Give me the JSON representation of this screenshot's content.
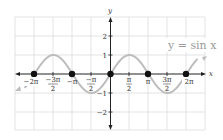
{
  "chart_data": {
    "type": "line",
    "title": "",
    "function_label": "y = sin x",
    "xlabel": "x",
    "ylabel": "y",
    "xlim": [
      -5.5,
      5.5
    ],
    "ylim": [
      -3,
      3
    ],
    "grid": true,
    "x_tick_labels": [
      {
        "value": -6.2832,
        "label": "−2π"
      },
      {
        "value": -4.7124,
        "label": "−3π/2"
      },
      {
        "value": -3.1416,
        "label": "−π"
      },
      {
        "value": -1.5708,
        "label": "−π/2"
      },
      {
        "value": 1.5708,
        "label": "π/2"
      },
      {
        "value": 3.1416,
        "label": "π"
      },
      {
        "value": 4.7124,
        "label": "3π/2"
      },
      {
        "value": 6.2832,
        "label": "2π"
      }
    ],
    "y_tick_labels": [
      {
        "value": 2,
        "label": "2"
      },
      {
        "value": 1,
        "label": "1"
      },
      {
        "value": -1,
        "label": "−1"
      },
      {
        "value": -2,
        "label": "−2"
      }
    ],
    "series": [
      {
        "name": "y = sin x",
        "color": "#b8b8b8",
        "x": [
          -6.2832,
          -4.7124,
          -3.1416,
          -1.5708,
          0,
          1.5708,
          3.1416,
          4.7124,
          6.2832
        ],
        "y": [
          0,
          1,
          0,
          -1,
          0,
          1,
          0,
          -1,
          0
        ]
      }
    ],
    "marked_points": [
      {
        "x": -6.2832,
        "y": 0
      },
      {
        "x": -3.1416,
        "y": 0
      },
      {
        "x": 0,
        "y": 0
      },
      {
        "x": 3.1416,
        "y": 0
      },
      {
        "x": 6.2832,
        "y": 0
      }
    ]
  },
  "labels": {
    "func": "y = sin x",
    "x_axis": "x",
    "y_axis": "y",
    "xt": [
      "−2π",
      "−3π",
      "2",
      "−π",
      "−π",
      "2",
      "π",
      "2",
      "π",
      "3π",
      "2",
      "2π"
    ],
    "yt": [
      "2",
      "1",
      "−1",
      "−2"
    ]
  }
}
